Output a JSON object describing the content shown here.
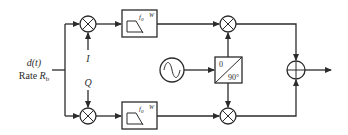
{
  "diagram": {
    "type": "IQ modulator block diagram",
    "input": {
      "signal_label": "d(t)",
      "rate_prefix": "Rate ",
      "rate_symbol": "R",
      "rate_subscript": "b"
    },
    "branches": {
      "top": {
        "label": "I"
      },
      "bottom": {
        "label": "Q"
      }
    },
    "filter": {
      "label_main": "f",
      "label_sub": "0",
      "label_extra": "W",
      "shape": "low-pass"
    },
    "oscillator": {
      "icon": "sine-wave"
    },
    "phase_shifter": {
      "top_label": "0",
      "bottom_label": "90°"
    },
    "mixer_symbol": "⊗",
    "summer_symbol": "⊕",
    "colors": {
      "stroke": "#2b2b2b",
      "background": "#ffffff"
    }
  }
}
